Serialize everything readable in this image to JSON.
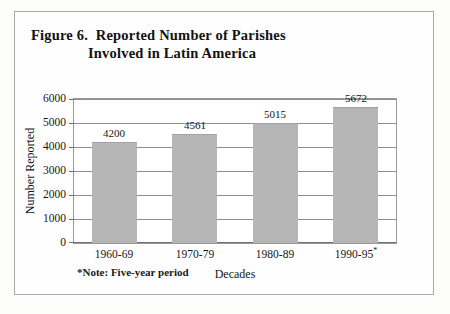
{
  "figure": {
    "title_lines": [
      "Figure 6.  Reported Number of Parishes",
      "Involved in Latin America"
    ],
    "footnote": "*Note: Five-year period",
    "border_color": "#a9a9a9",
    "bar_color": "#b6b6b6",
    "gridline_color": "#8e8e8e"
  },
  "chart_data": {
    "type": "bar",
    "title": "Figure 6.  Reported Number of Parishes Involved in Latin America",
    "categories": [
      "1960-69",
      "1970-79",
      "1980-89",
      "1990-95*"
    ],
    "values": [
      4200,
      4561,
      5015,
      5672
    ],
    "value_labels": [
      "4200",
      "4561",
      "5015",
      "5672"
    ],
    "xlabel": "Decades",
    "ylabel": "Number Reported",
    "ylim": [
      0,
      6000
    ],
    "yticks": [
      0,
      1000,
      2000,
      3000,
      4000,
      5000,
      6000
    ],
    "ytick_labels": [
      "0",
      "1000",
      "2000",
      "3000",
      "4000",
      "5000",
      "6000"
    ],
    "grid": true,
    "legend": "none",
    "annotations": [
      "*Note: Five-year period"
    ]
  }
}
